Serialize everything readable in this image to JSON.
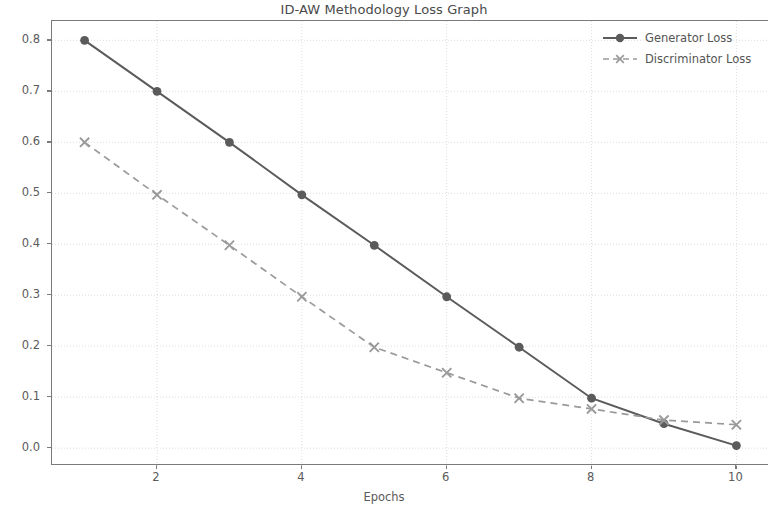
{
  "chart_data": {
    "type": "line",
    "title": "ID-AW Methodology Loss Graph",
    "xlabel": "Epochs",
    "ylabel": "Loss",
    "x": [
      1,
      2,
      3,
      4,
      5,
      6,
      7,
      8,
      9,
      10
    ],
    "xlim": [
      0.55,
      10.45
    ],
    "ylim": [
      -0.035,
      0.838
    ],
    "xticks": [
      2,
      4,
      6,
      8,
      10
    ],
    "xtick_labels": [
      "2",
      "4",
      "6",
      "8",
      "10"
    ],
    "yticks": [
      0.0,
      0.1,
      0.2,
      0.3,
      0.4,
      0.5,
      0.6,
      0.7,
      0.8
    ],
    "ytick_labels": [
      "0.0",
      "0.1",
      "0.2",
      "0.3",
      "0.4",
      "0.5",
      "0.6",
      "0.7",
      "0.8"
    ],
    "grid": true,
    "legend_position": "upper right",
    "series": [
      {
        "name": "Generator Loss",
        "marker": "circle",
        "linestyle": "solid",
        "color": "#5b5b5b",
        "values": [
          0.8,
          0.7,
          0.6,
          0.497,
          0.398,
          0.297,
          0.198,
          0.098,
          0.048,
          0.005
        ]
      },
      {
        "name": "Discriminator Loss",
        "marker": "x",
        "linestyle": "dashed",
        "color": "#9a9a9a",
        "values": [
          0.6,
          0.497,
          0.398,
          0.297,
          0.198,
          0.148,
          0.098,
          0.077,
          0.055,
          0.046
        ]
      }
    ]
  },
  "legend": {
    "items": [
      {
        "label": "Generator Loss"
      },
      {
        "label": "Discriminator Loss"
      }
    ]
  }
}
